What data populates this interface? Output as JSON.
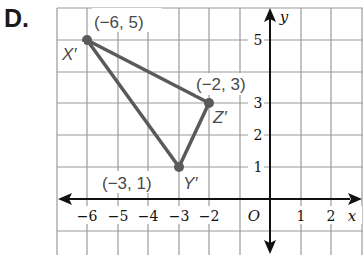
{
  "problem": {
    "label": "D."
  },
  "graph": {
    "x_ticks": [
      "−6",
      "−5",
      "−4",
      "−3",
      "−2",
      "1",
      "2"
    ],
    "y_ticks": [
      "1",
      "2",
      "3",
      "5"
    ],
    "origin_label": "O",
    "x_axis_label": "x",
    "y_axis_label": "y",
    "colors": {
      "grid": "#9a9a9a",
      "axis": "#111111",
      "triangle": "#5a5a5a"
    }
  },
  "triangle": {
    "vertices": [
      {
        "name": "X′",
        "coord_label": "(−6, 5)",
        "x": -6,
        "y": 5
      },
      {
        "name": "Y′",
        "coord_label": "(−3, 1)",
        "x": -3,
        "y": 1
      },
      {
        "name": "Z′",
        "coord_label": "(−2, 3)",
        "x": -2,
        "y": 3
      }
    ]
  }
}
